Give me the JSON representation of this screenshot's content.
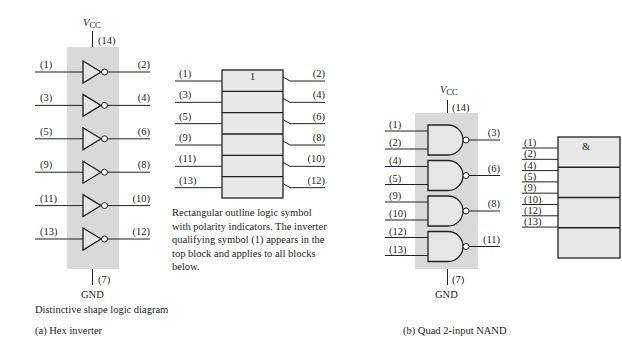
{
  "hex_inverter": {
    "vcc_label": "V",
    "vcc_sub": "CC",
    "vcc_pin": "(14)",
    "gnd_label": "GND",
    "gnd_pin": "(7)",
    "gates": [
      {
        "input": "(1)",
        "output": "(2)"
      },
      {
        "input": "(3)",
        "output": "(4)"
      },
      {
        "input": "(5)",
        "output": "(6)"
      },
      {
        "input": "(9)",
        "output": "(8)"
      },
      {
        "input": "(11)",
        "output": "(10)"
      },
      {
        "input": "(13)",
        "output": "(12)"
      }
    ],
    "distinctive_caption": "Distinctive shape logic diagram",
    "rect_symbol": {
      "qualifier": "1",
      "rows": [
        {
          "input": "(1)",
          "output": "(2)"
        },
        {
          "input": "(3)",
          "output": "(4)"
        },
        {
          "input": "(5)",
          "output": "(6)"
        },
        {
          "input": "(9)",
          "output": "(8)"
        },
        {
          "input": "(11)",
          "output": "(10)"
        },
        {
          "input": "(13)",
          "output": "(12)"
        }
      ],
      "caption_lines": [
        "Rectangular outline logic symbol",
        "with polarity indicators.  The inverter",
        "qualifying symbol (1) appears in the",
        "top block and applies to all blocks",
        "below."
      ]
    },
    "figure_caption": "(a) Hex inverter"
  },
  "quad_nand": {
    "vcc_label": "V",
    "vcc_sub": "CC",
    "vcc_pin": "(14)",
    "gnd_label": "GND",
    "gnd_pin": "(7)",
    "gates": [
      {
        "inputs": [
          "(1)",
          "(2)"
        ],
        "output": "(3)"
      },
      {
        "inputs": [
          "(4)",
          "(5)"
        ],
        "output": "(6)"
      },
      {
        "inputs": [
          "(9)",
          "(10)"
        ],
        "output": "(8)"
      },
      {
        "inputs": [
          "(12)",
          "(13)"
        ],
        "output": "(11)"
      }
    ],
    "rect_symbol": {
      "qualifier": "&",
      "inputs": [
        "(1)",
        "(2)",
        "(4)",
        "(5)",
        "(9)",
        "(10)",
        "(12)",
        "(13)"
      ]
    },
    "figure_caption": "(b) Quad 2-input NAND"
  }
}
